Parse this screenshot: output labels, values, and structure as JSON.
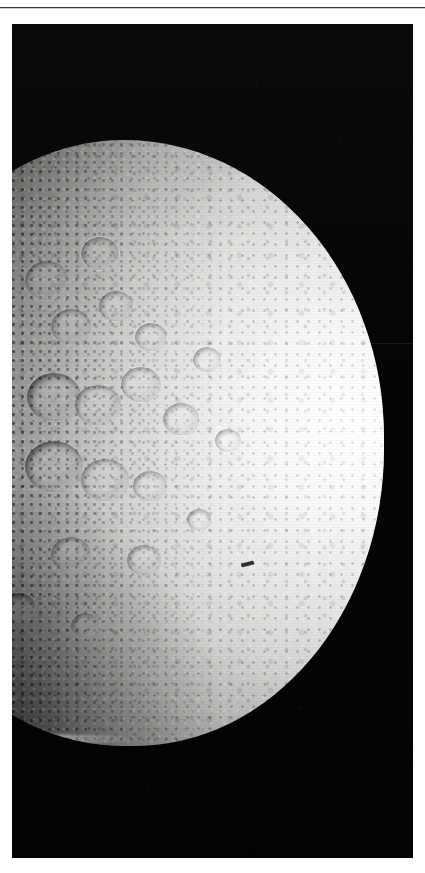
{
  "page": {
    "background_color": "#ffffff",
    "rule": {
      "name": "horizontal-rule",
      "color": "#3a3a3a",
      "y": 7
    }
  },
  "figure": {
    "kind": "spacecraft-photograph",
    "frame": {
      "x": 12,
      "y": 24,
      "width": 401,
      "height": 834
    },
    "background_color": "#050505",
    "caption": ""
  },
  "scene": {
    "space": {
      "label": "black space background",
      "color": "#050505",
      "artifacts": [
        {
          "name": "horizontal-scan-line",
          "position": "upper right sky"
        }
      ]
    },
    "body": {
      "label": "moon disk",
      "phase": "gibbous, illuminated from the right",
      "surface": "densely cratered icy regolith",
      "bright_limb_color": "#f3f3f1",
      "midtone_color": "#b4b4b2",
      "terminator_color": "#404042",
      "disk": {
        "left": -138,
        "top": 116,
        "width": 510,
        "height": 606
      }
    },
    "craters": [
      {
        "name": "large-crater-upper-left",
        "left": 46,
        "top": 74,
        "size": 96,
        "style": "shadowed"
      },
      {
        "name": "crater-upper-left-small",
        "left": 20,
        "top": 120,
        "size": 40,
        "style": "plain"
      },
      {
        "name": "crater-upper-mid",
        "left": 150,
        "top": 120,
        "size": 44,
        "style": "plain"
      },
      {
        "name": "crater-upper-right",
        "left": 206,
        "top": 96,
        "size": 38,
        "style": "bright-rim"
      },
      {
        "name": "crater-mid-upper-a",
        "left": 176,
        "top": 168,
        "size": 40,
        "style": "plain"
      },
      {
        "name": "crater-mid-upper-b",
        "left": 224,
        "top": 150,
        "size": 34,
        "style": "plain"
      },
      {
        "name": "crater-mid-upper-c",
        "left": 260,
        "top": 182,
        "size": 32,
        "style": "bright-rim"
      },
      {
        "name": "crater-central-a",
        "left": 152,
        "top": 232,
        "size": 54,
        "style": "shadowed"
      },
      {
        "name": "crater-central-b",
        "left": 200,
        "top": 244,
        "size": 46,
        "style": "plain"
      },
      {
        "name": "crater-central-c",
        "left": 246,
        "top": 226,
        "size": 40,
        "style": "bright-rim"
      },
      {
        "name": "crater-central-d",
        "left": 288,
        "top": 262,
        "size": 36,
        "style": "plain"
      },
      {
        "name": "crater-lower-central-a",
        "left": 150,
        "top": 300,
        "size": 58,
        "style": "shadowed"
      },
      {
        "name": "crater-lower-central-b",
        "left": 206,
        "top": 318,
        "size": 48,
        "style": "plain"
      },
      {
        "name": "crater-lower-central-c",
        "left": 258,
        "top": 330,
        "size": 34,
        "style": "plain"
      },
      {
        "name": "crater-lower-left",
        "left": 96,
        "top": 352,
        "size": 42,
        "style": "shadowed"
      },
      {
        "name": "crater-lower-mid",
        "left": 176,
        "top": 396,
        "size": 40,
        "style": "plain"
      },
      {
        "name": "crater-lower-right",
        "left": 252,
        "top": 404,
        "size": 34,
        "style": "plain"
      },
      {
        "name": "crater-bottom-left",
        "left": 128,
        "top": 452,
        "size": 32,
        "style": "shadowed"
      },
      {
        "name": "crater-bottom-mid",
        "left": 196,
        "top": 472,
        "size": 28,
        "style": "plain"
      },
      {
        "name": "crater-right-upper",
        "left": 318,
        "top": 206,
        "size": 28,
        "style": "bright-rim"
      },
      {
        "name": "crater-right-mid",
        "left": 340,
        "top": 288,
        "size": 26,
        "style": "bright-rim"
      },
      {
        "name": "crater-right-lower",
        "left": 312,
        "top": 368,
        "size": 24,
        "style": "plain"
      }
    ],
    "marks": [
      {
        "name": "fiducial-mark",
        "description": "small dark dust speck on the bright disk"
      }
    ]
  }
}
